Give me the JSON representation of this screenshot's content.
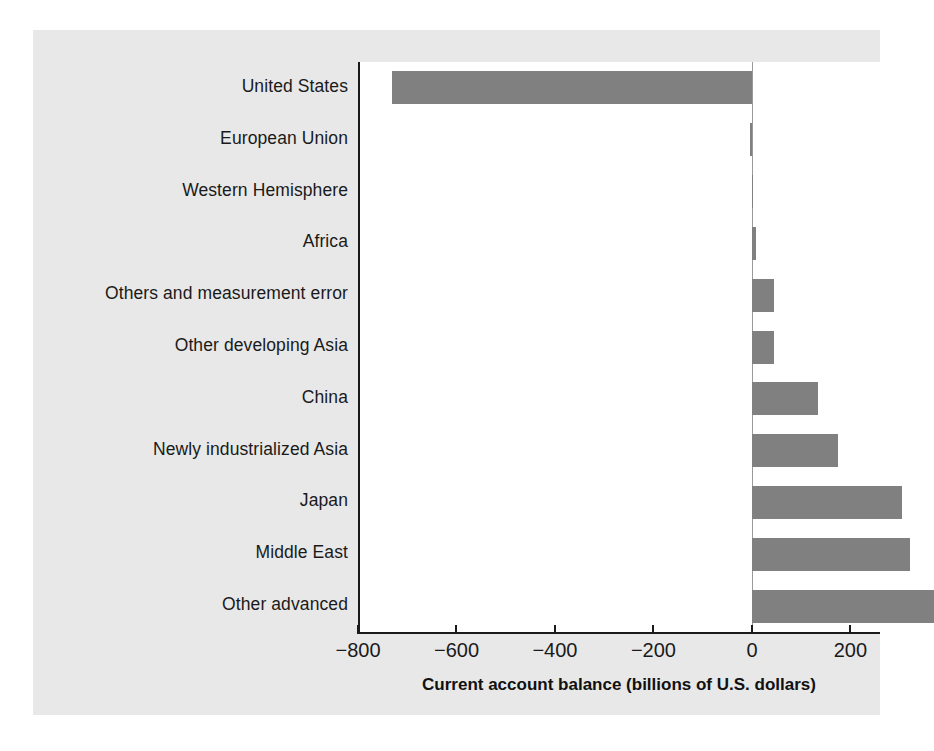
{
  "figure": {
    "background_color": "#e8e8e8",
    "plot_background_color": "#ffffff",
    "bar_color": "#808080",
    "axis_color": "#1a1a1a"
  },
  "chart_data": {
    "type": "bar",
    "orientation": "horizontal",
    "title": "",
    "subtitle": "",
    "xlabel": "Current account balance (billions of U.S. dollars)",
    "ylabel": "",
    "xlim": [
      -800,
      260
    ],
    "xticks": [
      -800,
      -600,
      -400,
      -200,
      0,
      200
    ],
    "xticklabels": [
      "−800",
      "−600",
      "−400",
      "−200",
      "0",
      "200"
    ],
    "grid": false,
    "legend": false,
    "zero_line": true,
    "units": "billions of U.S. dollars",
    "categories": [
      "United States",
      "European Union",
      "Western Hemisphere",
      "Africa",
      "Others and measurement error",
      "Other developing Asia",
      "China",
      "Newly industrialized Asia",
      "Japan",
      "Middle East",
      "Other advanced"
    ],
    "values": [
      -730,
      -4,
      3,
      8,
      45,
      45,
      135,
      175,
      305,
      320,
      370
    ],
    "series": [
      {
        "name": "Current account balance",
        "values": [
          -730,
          -4,
          3,
          8,
          45,
          45,
          135,
          175,
          305,
          320,
          370
        ]
      }
    ],
    "bars": [
      {
        "label": "United States",
        "value": -730
      },
      {
        "label": "European Union",
        "value": -4
      },
      {
        "label": "Western Hemisphere",
        "value": 3
      },
      {
        "label": "Africa",
        "value": 8
      },
      {
        "label": "Others and measurement error",
        "value": 45
      },
      {
        "label": "Other developing Asia",
        "value": 45
      },
      {
        "label": "China",
        "value": 135
      },
      {
        "label": "Newly industrialized Asia",
        "value": 175
      },
      {
        "label": "Japan",
        "value": 305
      },
      {
        "label": "Middle East",
        "value": 320
      },
      {
        "label": "Other advanced",
        "value": 370
      }
    ]
  }
}
